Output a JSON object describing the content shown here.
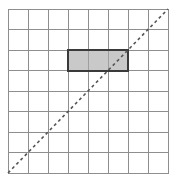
{
  "figure": {
    "title": "",
    "background_color": "#ffffff"
  },
  "chart_data": {
    "type": "table",
    "title": "",
    "xlabel": "",
    "ylabel": "",
    "grid": true,
    "legend": "none",
    "grid_columns": 8,
    "grid_rows": 8,
    "xlim": [
      0,
      8
    ],
    "ylim": [
      0,
      8
    ],
    "categories": [
      "1",
      "2",
      "3",
      "4",
      "5",
      "6",
      "7",
      "8"
    ],
    "values": [
      0,
      0,
      0,
      0,
      0,
      0,
      0,
      0
    ],
    "cell_width": 20,
    "cell_height": 20.5,
    "grid_origin_x": 8,
    "grid_origin_y": 9,
    "annotations": [
      {
        "name": "shaded-rectangle",
        "shape": "rectangle",
        "col_start": 3,
        "col_span": 3,
        "row_start": 2,
        "row_span": 1,
        "fill_color": "#c9c9c9",
        "stroke_color": "#3a3a3a",
        "stroke_width": 2,
        "area_cells": 3,
        "label": ""
      },
      {
        "name": "diagonal-dashed-line",
        "shape": "line",
        "from": [
          0,
          0
        ],
        "to": [
          8,
          8
        ],
        "style": "dashed",
        "stroke_color": "#555555",
        "stroke_width": 1.6,
        "dash_pattern": "3 3",
        "label": ""
      }
    ]
  },
  "grid_style": {
    "line_color": "#8e8e8e",
    "line_width": 1,
    "border_color": "#8e8e8e",
    "border_width": 1
  }
}
